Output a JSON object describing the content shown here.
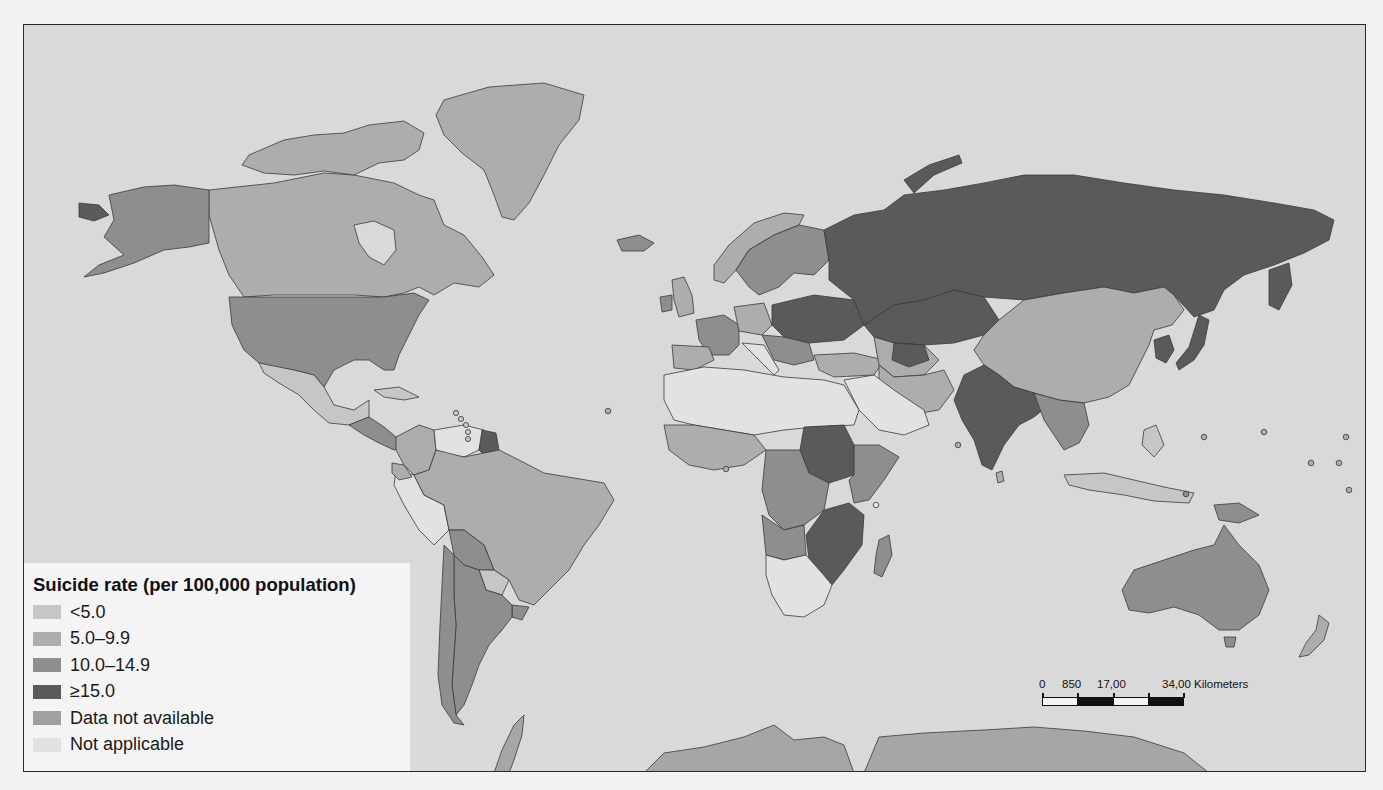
{
  "map": {
    "title": "Suicide rate (per 100,000 population)",
    "colors": {
      "ocean": "#d9d9d9",
      "lt5": "#c6c6c6",
      "r5_10": "#adadad",
      "r10_15": "#8e8e8e",
      "gte15": "#5a5a5a",
      "no_data": "#a6a6a6",
      "not_applicable": "#e0e0e0",
      "border": "#3a3a3a"
    }
  },
  "legend": {
    "title": "Suicide rate (per 100,000 population)",
    "items": [
      {
        "label": "<5.0",
        "color": "#c6c6c6"
      },
      {
        "label": "5.0–9.9",
        "color": "#adadad"
      },
      {
        "label": "10.0–14.9",
        "color": "#8e8e8e"
      },
      {
        "label": "≥15.0",
        "color": "#5a5a5a"
      },
      {
        "label": "Data not available",
        "color": "#a0a0a0"
      },
      {
        "label": "Not applicable",
        "color": "#e2e2e2"
      }
    ]
  },
  "scalebar": {
    "labels": [
      "0",
      "850",
      "17,00",
      "34,00 Kilometers"
    ]
  },
  "regions": [
    {
      "name": "Russia",
      "category": "≥15.0"
    },
    {
      "name": "Kazakhstan",
      "category": "≥15.0"
    },
    {
      "name": "Ukraine",
      "category": "≥15.0"
    },
    {
      "name": "Belarus",
      "category": "≥15.0"
    },
    {
      "name": "Poland",
      "category": "≥15.0"
    },
    {
      "name": "India",
      "category": "≥15.0"
    },
    {
      "name": "South Korea",
      "category": "≥15.0"
    },
    {
      "name": "Japan",
      "category": "≥15.0"
    },
    {
      "name": "Guyana",
      "category": "≥15.0"
    },
    {
      "name": "Sudan",
      "category": "≥15.0"
    },
    {
      "name": "Tanzania",
      "category": "≥15.0"
    },
    {
      "name": "Zambia",
      "category": "≥15.0"
    },
    {
      "name": "Mozambique",
      "category": "≥15.0"
    },
    {
      "name": "United States",
      "category": "10.0–14.9"
    },
    {
      "name": "Alaska",
      "category": "10.0–14.9"
    },
    {
      "name": "Australia",
      "category": "10.0–14.9"
    },
    {
      "name": "France",
      "category": "10.0–14.9"
    },
    {
      "name": "Argentina",
      "category": "10.0–14.9"
    },
    {
      "name": "Chile",
      "category": "10.0–14.9"
    },
    {
      "name": "Bolivia",
      "category": "10.0–14.9"
    },
    {
      "name": "DR Congo",
      "category": "10.0–14.9"
    },
    {
      "name": "Angola",
      "category": "10.0–14.9"
    },
    {
      "name": "Ethiopia",
      "category": "10.0–14.9"
    },
    {
      "name": "Madagascar",
      "category": "10.0–14.9"
    },
    {
      "name": "Canada",
      "category": "5.0–9.9"
    },
    {
      "name": "Brazil",
      "category": "5.0–9.9"
    },
    {
      "name": "China",
      "category": "5.0–9.9"
    },
    {
      "name": "Greenland",
      "category": "5.0–9.9"
    },
    {
      "name": "Mexico",
      "category": "<5.0"
    },
    {
      "name": "Peru",
      "category": "<5.0"
    },
    {
      "name": "North Africa",
      "category": "<5.0"
    },
    {
      "name": "Southern Africa",
      "category": "<5.0"
    },
    {
      "name": "Arabian Peninsula",
      "category": "<5.0"
    },
    {
      "name": "Indonesia",
      "category": "<5.0"
    },
    {
      "name": "Antarctica",
      "category": "Data not available"
    }
  ]
}
